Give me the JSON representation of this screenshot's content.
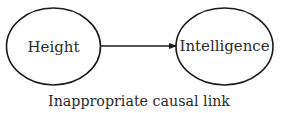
{
  "diagram": {
    "nodes": [
      {
        "id": "height",
        "label": "Height"
      },
      {
        "id": "intelligence",
        "label": "Intelligence"
      }
    ],
    "edges": [
      {
        "from": "height",
        "to": "intelligence",
        "type": "directed-arrow"
      }
    ],
    "caption": "Inappropriate causal link",
    "colors": {
      "stroke": "#1a1a1a",
      "text": "#2a2a2a",
      "background": "#ffffff"
    }
  }
}
